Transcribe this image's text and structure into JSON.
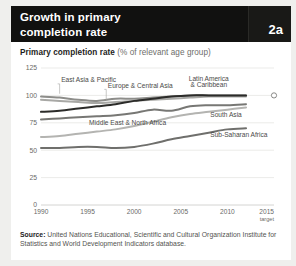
{
  "header": {
    "title_line1": "Growth in primary",
    "title_line2": "completion rate",
    "badge": "2a",
    "bg_color": "#111110"
  },
  "subtitle": {
    "bold": "Primary completion rate",
    "normal": " (% of relevant age group)"
  },
  "source": {
    "label": "Source:",
    "text": " United Nations Educational, Scientific and Cultural Organization Institute for Statistics and World Development Indicators database."
  },
  "chart_data": {
    "type": "line",
    "title": "Growth in primary completion rate",
    "subtitle": "Primary completion rate (% of relevant age group)",
    "xlabel": "",
    "ylabel": "",
    "xlim": [
      1990,
      2015
    ],
    "ylim": [
      0,
      125
    ],
    "yticks": [
      125,
      100,
      75,
      50,
      25,
      0
    ],
    "xticks": [
      1990,
      1995,
      2000,
      2005,
      2010,
      2015
    ],
    "xtick_labels": [
      "1990",
      "1995",
      "2000",
      "2005",
      "2010",
      "2015"
    ],
    "xtick_sublabel_last": "target",
    "grid": "horizontal",
    "legend": "inline-annotations",
    "target_marker": {
      "year": 2015,
      "value": 100,
      "style": "open-circle"
    },
    "x": [
      1990,
      1992,
      1994,
      1996,
      1998,
      2000,
      2002,
      2004,
      2006,
      2008,
      2010,
      2012
    ],
    "series": [
      {
        "name": "East Asia & Pacific",
        "color": "#8d8d8a",
        "values": [
          99,
          98,
          96,
          95,
          97,
          97,
          98,
          99,
          100,
          100,
          100,
          100
        ]
      },
      {
        "name": "Europe & Central Asia",
        "color": "#a8a8a5",
        "values": [
          96,
          95,
          94,
          93,
          94,
          95,
          96,
          97,
          98,
          99,
          99,
          99
        ]
      },
      {
        "name": "Latin America & Caribbean",
        "color": "#2b2b29",
        "values": [
          85,
          86,
          88,
          90,
          92,
          95,
          97,
          99,
          100,
          100,
          100,
          100
        ]
      },
      {
        "name": "Middle East & North Africa",
        "color": "#777774",
        "values": [
          78,
          79,
          80,
          81,
          82,
          84,
          87,
          86,
          90,
          91,
          91,
          92
        ]
      },
      {
        "name": "South Asia",
        "color": "#b4b4b1",
        "values": [
          62,
          63,
          65,
          67,
          69,
          72,
          76,
          80,
          83,
          85,
          87,
          89
        ]
      },
      {
        "name": "Sub-Saharan Africa",
        "color": "#6f6f6c",
        "values": [
          52,
          52,
          53,
          53,
          52,
          53,
          56,
          60,
          63,
          66,
          69,
          70
        ]
      }
    ],
    "annotations": [
      {
        "text": "East Asia & Pacific",
        "x": 1992,
        "y": 112
      },
      {
        "text": "Europe & Central Asia",
        "x": 1997,
        "y": 107
      },
      {
        "text": "Latin America",
        "x": 2008,
        "y": 113
      },
      {
        "text": "& Caribbean",
        "x": 2008,
        "y": 108
      },
      {
        "text": "Middle East & North Africa",
        "x": 1995,
        "y": 73
      },
      {
        "text": "South Asia",
        "x": 2008,
        "y": 80
      },
      {
        "text": "Sub-Saharan Africa",
        "x": 2008,
        "y": 62
      }
    ]
  }
}
